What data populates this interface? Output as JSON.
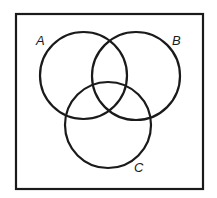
{
  "diagram": {
    "type": "venn",
    "universe": {
      "x": 16,
      "y": 14,
      "width": 187,
      "height": 175,
      "stroke": "#1a1a1a"
    },
    "sets": [
      {
        "name": "A",
        "cx": 83.5,
        "cy": 75.5,
        "r": 43.5,
        "label_x": 36,
        "label_y": 45
      },
      {
        "name": "B",
        "cx": 136,
        "cy": 76,
        "r": 44,
        "label_x": 172,
        "label_y": 45
      },
      {
        "name": "C",
        "cx": 108,
        "cy": 125,
        "r": 43,
        "label_x": 134,
        "label_y": 172
      }
    ],
    "stroke_color": "#1a1a1a",
    "stroke_width": 2.2
  },
  "labels": {
    "a": "A",
    "b": "B",
    "c": "C"
  }
}
